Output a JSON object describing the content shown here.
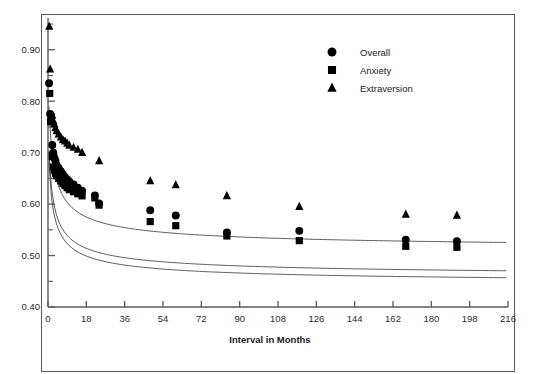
{
  "figure": {
    "background_color": "#ffffff",
    "frame_color": "#5a5a5a",
    "marker_color": "#000000",
    "curve_color": "#4a4a4a"
  },
  "chart_data": {
    "type": "scatter",
    "title": "",
    "subtitle": "",
    "xlabel": "Interval in Months",
    "ylabel": "",
    "xlim": [
      0,
      216
    ],
    "ylim": [
      0.4,
      0.95
    ],
    "xticks": [
      0,
      18,
      36,
      54,
      72,
      90,
      108,
      126,
      144,
      162,
      180,
      198,
      216
    ],
    "xtick_labels": [
      "0",
      "18",
      "36",
      "54",
      "72",
      "90",
      "108",
      "126",
      "144",
      "162",
      "180",
      "198",
      "216"
    ],
    "yticks": [
      0.4,
      0.5,
      0.6,
      0.7,
      0.8,
      0.9
    ],
    "ytick_labels": [
      "0.40",
      "0.50",
      "0.60",
      "0.70",
      "0.80",
      "0.90"
    ],
    "yminor_ticks": [
      0.45,
      0.55,
      0.65,
      0.75,
      0.85,
      0.95
    ],
    "grid": false,
    "legend_position": "top-right",
    "series": [
      {
        "name": "Overall",
        "marker": "circle",
        "points": [
          [
            0.5,
            0.835
          ],
          [
            1.0,
            0.775
          ],
          [
            1.5,
            0.772
          ],
          [
            2.0,
            0.715
          ],
          [
            2.5,
            0.7
          ],
          [
            3.0,
            0.69
          ],
          [
            3.5,
            0.684
          ],
          [
            4.0,
            0.676
          ],
          [
            5.0,
            0.67
          ],
          [
            6.0,
            0.664
          ],
          [
            7.0,
            0.658
          ],
          [
            8.0,
            0.652
          ],
          [
            9.0,
            0.648
          ],
          [
            10.0,
            0.644
          ],
          [
            12.0,
            0.638
          ],
          [
            14.0,
            0.632
          ],
          [
            16.0,
            0.626
          ],
          [
            22.0,
            0.617
          ],
          [
            24.0,
            0.601
          ],
          [
            48.0,
            0.588
          ],
          [
            60.0,
            0.578
          ],
          [
            84.0,
            0.545
          ],
          [
            118.0,
            0.548
          ],
          [
            168.0,
            0.531
          ],
          [
            192.0,
            0.528
          ]
        ]
      },
      {
        "name": "Anxiety",
        "marker": "square",
        "points": [
          [
            0.8,
            0.815
          ],
          [
            1.2,
            0.76
          ],
          [
            2.0,
            0.692
          ],
          [
            2.5,
            0.672
          ],
          [
            3.0,
            0.666
          ],
          [
            3.5,
            0.66
          ],
          [
            4.0,
            0.655
          ],
          [
            5.0,
            0.65
          ],
          [
            6.0,
            0.645
          ],
          [
            7.0,
            0.64
          ],
          [
            8.0,
            0.636
          ],
          [
            9.0,
            0.632
          ],
          [
            10.0,
            0.628
          ],
          [
            12.0,
            0.624
          ],
          [
            14.0,
            0.62
          ],
          [
            16.0,
            0.616
          ],
          [
            22.0,
            0.612
          ],
          [
            24.0,
            0.598
          ],
          [
            48.0,
            0.566
          ],
          [
            60.0,
            0.558
          ],
          [
            84.0,
            0.538
          ],
          [
            118.0,
            0.529
          ],
          [
            168.0,
            0.518
          ],
          [
            192.0,
            0.516
          ]
        ]
      },
      {
        "name": "Extraversion",
        "marker": "triangle",
        "points": [
          [
            0.6,
            0.945
          ],
          [
            1.0,
            0.862
          ],
          [
            2.0,
            0.772
          ],
          [
            2.5,
            0.762
          ],
          [
            3.0,
            0.755
          ],
          [
            3.5,
            0.748
          ],
          [
            4.0,
            0.742
          ],
          [
            5.0,
            0.736
          ],
          [
            6.0,
            0.73
          ],
          [
            7.0,
            0.725
          ],
          [
            8.0,
            0.722
          ],
          [
            9.0,
            0.718
          ],
          [
            10.0,
            0.714
          ],
          [
            12.0,
            0.71
          ],
          [
            14.0,
            0.706
          ],
          [
            16.0,
            0.7
          ],
          [
            24.0,
            0.684
          ],
          [
            48.0,
            0.645
          ],
          [
            60.0,
            0.637
          ],
          [
            84.0,
            0.616
          ],
          [
            118.0,
            0.595
          ],
          [
            168.0,
            0.58
          ],
          [
            192.0,
            0.578
          ]
        ]
      }
    ],
    "fitted_curves": [
      {
        "name": "Overall",
        "params": {
          "a": 0.455,
          "b": 0.3,
          "c": 0.235
        }
      },
      {
        "name": "Anxiety",
        "params": {
          "a": 0.442,
          "b": 0.29,
          "c": 0.235
        }
      },
      {
        "name": "Extraversion",
        "params": {
          "a": 0.508,
          "b": 0.34,
          "c": 0.235
        }
      }
    ]
  },
  "legend": {
    "entries": [
      {
        "label": "Overall",
        "marker": "circle"
      },
      {
        "label": "Anxiety",
        "marker": "square"
      },
      {
        "label": "Extraversion",
        "marker": "triangle"
      }
    ]
  },
  "caption_fragment": ""
}
